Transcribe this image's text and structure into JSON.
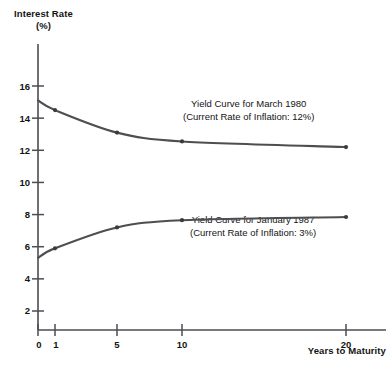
{
  "chart_data": {
    "type": "line",
    "title": "",
    "xlabel": "Years to Maturity",
    "ylabel": "Interest Rate\n(%)",
    "ylabel_line1": "Interest Rate",
    "ylabel_line2": "(%)",
    "xticks": [
      "0",
      "1",
      "5",
      "10",
      "20"
    ],
    "xtick_values": [
      0,
      1,
      5,
      10,
      20
    ],
    "yticks": [
      "2",
      "4",
      "6",
      "8",
      "10",
      "12",
      "14",
      "16"
    ],
    "ytick_values": [
      2,
      4,
      6,
      8,
      10,
      12,
      14,
      16
    ],
    "xlim": [
      0,
      22
    ],
    "ylim": [
      0,
      17
    ],
    "grid": false,
    "legend": "annotations",
    "line_color": "#4d4d52",
    "axis_color": "#4d4d52",
    "background": "#ffffff",
    "series": [
      {
        "name": "Yield Curve for March 1980",
        "x": [
          0,
          1,
          5,
          10,
          20
        ],
        "values": [
          15.1,
          14.5,
          13.1,
          12.55,
          12.2
        ],
        "markers": true,
        "annotation_line1": "Yield Curve for March 1980",
        "annotation_line2": "(Current Rate of Inflation: 12%)"
      },
      {
        "name": "Yield Curve for January 1987",
        "x": [
          0,
          1,
          5,
          10,
          20
        ],
        "values": [
          5.3,
          5.9,
          7.2,
          7.65,
          7.85
        ],
        "markers": true,
        "annotation_line1": "Yield Curve for January 1987",
        "annotation_line2": "(Current Rate of Inflation: 3%)"
      }
    ]
  },
  "annotations": {
    "curve_1980": {
      "line1": "Yield Curve for March 1980",
      "line2": "(Current Rate of Inflation: 12%)"
    },
    "curve_1987": {
      "line1": "Yield Curve for January 1987",
      "line2": "(Current Rate of Inflation: 3%)"
    }
  },
  "axes": {
    "y_title_line1": "Interest Rate",
    "y_title_line2": "(%)",
    "x_title": "Years to Maturity",
    "y_ticks": [
      "16",
      "14",
      "12",
      "10",
      "8",
      "6",
      "4",
      "2"
    ],
    "x_ticks": [
      "0",
      "1",
      "5",
      "10",
      "20"
    ]
  }
}
